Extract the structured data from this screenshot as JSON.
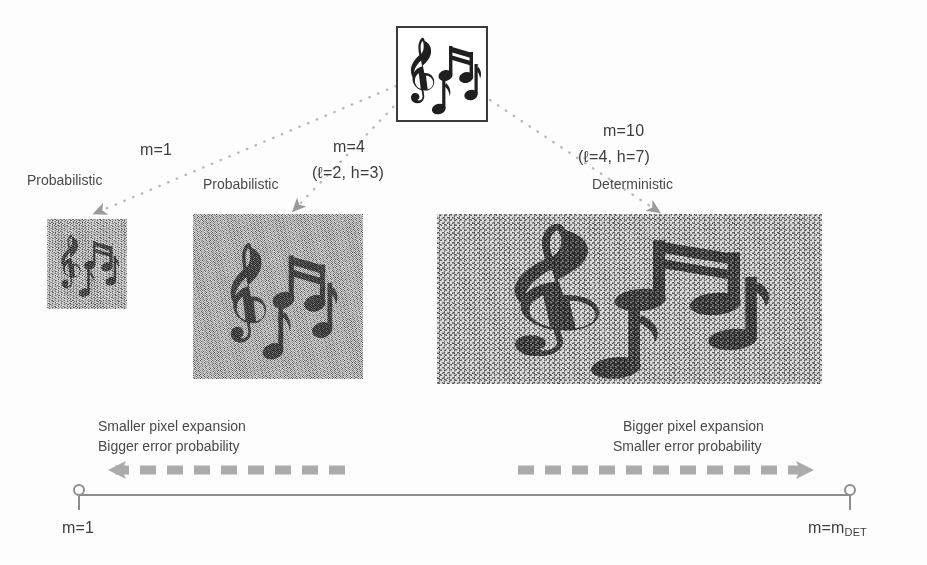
{
  "figure": {
    "source_image": {
      "name": "secret-image",
      "icon": "music-notes-icon",
      "alt": "Musical notes secret image"
    },
    "branches": [
      {
        "id": "branch-m1",
        "scheme_label": "Probabilistic",
        "m_label": "m=1",
        "params_label": "",
        "share": {
          "name": "share-image-m1",
          "width": 80,
          "height": 90,
          "noise": "fine",
          "alt": "Highly noisy small share, music notes barely visible"
        }
      },
      {
        "id": "branch-m4",
        "scheme_label": "Probabilistic",
        "m_label": "m=4",
        "params_label": "(ℓ=2, h=3)",
        "share": {
          "name": "share-image-m4",
          "width": 170,
          "height": 165,
          "noise": "medium",
          "alt": "Medium noisy share, music notes recognizable"
        }
      },
      {
        "id": "branch-m10",
        "scheme_label": "Deterministic",
        "m_label": "m=10",
        "params_label": "(ℓ=4, h=7)",
        "share": {
          "name": "share-image-m10",
          "width": 385,
          "height": 170,
          "noise": "coarse",
          "alt": "Large share, music notes clearly visible"
        }
      }
    ],
    "annotations": {
      "left": {
        "line1": "Smaller pixel expansion",
        "line2": "Bigger error probability"
      },
      "right": {
        "line1": "Bigger pixel expansion",
        "line2": "Smaller error probability"
      }
    },
    "axis": {
      "left_endpoint": "m=1",
      "right_endpoint_prefix": "m=m",
      "right_endpoint_subscript": "DET",
      "left_arrow_direction": "left",
      "right_arrow_direction": "right",
      "arrow_style": "dashed"
    },
    "colors": {
      "text": "#4a4a4a",
      "axis": "#8d8d8d",
      "arrow": "#a8a8a8",
      "connector": "#b9b9b9",
      "share_background": "#9b9b9b",
      "ink": "#3a3a3a",
      "page_background": "#fdfdfd"
    }
  }
}
